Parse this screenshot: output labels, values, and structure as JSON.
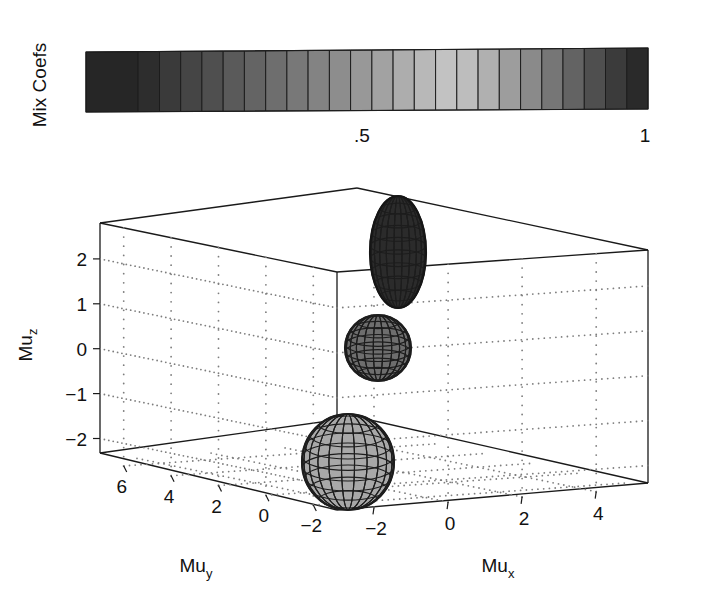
{
  "figure": {
    "background": "#ffffff",
    "ink": "#1a1a1a"
  },
  "colorbar": {
    "label": "Mix Coefs",
    "orientation": "horizontal",
    "x_left": 86,
    "x_right": 648,
    "y_top": 52,
    "y_bottom": 112,
    "ticks": [
      {
        "label": ".5",
        "value": 0.5,
        "x": 362
      },
      {
        "label": "1",
        "value": 1.0,
        "x": 645
      }
    ],
    "cells": [
      {
        "value": 0.02,
        "color": "#262626",
        "w": 59
      },
      {
        "value": 0.06,
        "color": "#2d2d2d",
        "w": 24
      },
      {
        "value": 0.1,
        "color": "#3a3a3a",
        "w": 24
      },
      {
        "value": 0.14,
        "color": "#454545",
        "w": 24
      },
      {
        "value": 0.18,
        "color": "#4f4f4f",
        "w": 24
      },
      {
        "value": 0.22,
        "color": "#5a5a5a",
        "w": 24
      },
      {
        "value": 0.26,
        "color": "#646464",
        "w": 24
      },
      {
        "value": 0.3,
        "color": "#6e6e6e",
        "w": 24
      },
      {
        "value": 0.34,
        "color": "#787878",
        "w": 24
      },
      {
        "value": 0.38,
        "color": "#838383",
        "w": 24
      },
      {
        "value": 0.42,
        "color": "#8d8d8d",
        "w": 24
      },
      {
        "value": 0.46,
        "color": "#989898",
        "w": 24
      },
      {
        "value": 0.5,
        "color": "#a2a2a2",
        "w": 24
      },
      {
        "value": 0.54,
        "color": "#adadad",
        "w": 24
      },
      {
        "value": 0.58,
        "color": "#b8b8b8",
        "w": 24
      },
      {
        "value": 0.62,
        "color": "#c2c2c2",
        "w": 24
      },
      {
        "value": 0.66,
        "color": "#bdbdbd",
        "w": 24
      },
      {
        "value": 0.7,
        "color": "#b0b0b0",
        "w": 24
      },
      {
        "value": 0.74,
        "color": "#9d9d9d",
        "w": 24
      },
      {
        "value": 0.78,
        "color": "#8a8a8a",
        "w": 24
      },
      {
        "value": 0.82,
        "color": "#767676",
        "w": 24
      },
      {
        "value": 0.86,
        "color": "#636363",
        "w": 24
      },
      {
        "value": 0.9,
        "color": "#4f4f4f",
        "w": 24
      },
      {
        "value": 0.94,
        "color": "#3b3b3b",
        "w": 24
      },
      {
        "value": 1.0,
        "color": "#2a2a2a",
        "w": 24
      }
    ]
  },
  "plot3d": {
    "axes": {
      "x": {
        "label": "Mu",
        "subscript": "x",
        "ticks": [
          "-2",
          "0",
          "2",
          "4"
        ],
        "tick_values": [
          -2,
          0,
          2,
          4
        ],
        "range": [
          -3,
          5.4
        ]
      },
      "y": {
        "label": "Mu",
        "subscript": "y",
        "ticks": [
          "6",
          "4",
          "2",
          "0",
          "-2"
        ],
        "tick_values": [
          6,
          4,
          2,
          0,
          -2
        ],
        "range": [
          -3,
          7
        ]
      },
      "z": {
        "label": "Mu",
        "subscript": "z",
        "ticks": [
          "2",
          "1",
          "0",
          "-1",
          "-2"
        ],
        "tick_values": [
          2,
          1,
          0,
          -1,
          -2
        ],
        "range": [
          -2.5,
          2.8
        ]
      }
    },
    "grid": "dotted",
    "spheres": [
      {
        "name": "ellipsoid-top",
        "cx": 398,
        "cy": 252,
        "rx": 28,
        "ry": 56,
        "fill": "#2b2b2b",
        "mesh": "#151515",
        "mix_coef": 0.08
      },
      {
        "name": "sphere-middle",
        "cx": 378,
        "cy": 348,
        "rx": 33,
        "ry": 33,
        "fill": "#6e6e6e",
        "mesh": "#1d1d1d",
        "mix_coef": 0.3
      },
      {
        "name": "sphere-bottom",
        "cx": 348,
        "cy": 462,
        "rx": 46,
        "ry": 48,
        "fill": "#a8a8a8",
        "mesh": "#1d1d1d",
        "mix_coef": 0.62
      }
    ]
  },
  "chart_data": {
    "type": "scatter",
    "title": "",
    "xlabel": "Mu_x",
    "ylabel": "Mu_y",
    "zlabel": "Mu_z",
    "colorbar_label": "Mix Coefs",
    "colorbar_ticks": [
      ".5",
      "1"
    ],
    "colorbar_range": [
      0,
      1
    ],
    "xlim": [
      -3,
      5.4
    ],
    "ylim": [
      -3,
      7
    ],
    "zlim": [
      -2.5,
      2.8
    ],
    "xticks": [
      -2,
      0,
      2,
      4
    ],
    "yticks": [
      6,
      4,
      2,
      0,
      -2
    ],
    "zticks": [
      2,
      1,
      0,
      -1,
      -2
    ],
    "grid": true,
    "legend": "none",
    "points": [
      {
        "label": "component-1",
        "mu_x": -1.0,
        "mu_y": -0.4,
        "mu_z": 2.2,
        "radius": 0.85,
        "mix_coef": 0.08,
        "shade": "#2b2b2b"
      },
      {
        "label": "component-2",
        "mu_x": -1.3,
        "mu_y": 0.2,
        "mu_z": 0.4,
        "radius": 0.55,
        "mix_coef": 0.3,
        "shade": "#6e6e6e"
      },
      {
        "label": "component-3",
        "mu_x": -1.6,
        "mu_y": 0.6,
        "mu_z": -1.6,
        "radius": 0.8,
        "mix_coef": 0.62,
        "shade": "#a8a8a8"
      }
    ]
  }
}
